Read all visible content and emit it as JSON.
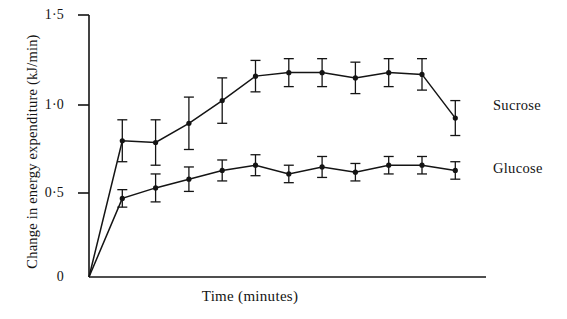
{
  "chart_data": {
    "type": "line",
    "title": "",
    "subtitle": "",
    "xlabel": "Time (minutes)",
    "ylabel": "Change in energy expenditure (kJ/min)",
    "ylim": [
      0,
      1.5
    ],
    "xlim": [
      0,
      12
    ],
    "grid": false,
    "legend_position": "right-inline",
    "ytick_labels": [
      "0",
      "0·5",
      "1·0",
      "1·5"
    ],
    "ytick_values": [
      0,
      0.5,
      1.0,
      1.5
    ],
    "xtick_labels": [],
    "x": [
      1,
      2,
      3,
      4,
      5,
      6,
      7,
      8,
      9,
      10,
      11
    ],
    "series": [
      {
        "name": "Sucrose",
        "values": [
          0.78,
          0.77,
          0.88,
          1.01,
          1.15,
          1.17,
          1.17,
          1.14,
          1.17,
          1.16,
          0.91
        ],
        "errors": [
          0.12,
          0.13,
          0.15,
          0.13,
          0.09,
          0.08,
          0.08,
          0.09,
          0.08,
          0.09,
          0.1
        ]
      },
      {
        "name": "Glucose",
        "values": [
          0.45,
          0.51,
          0.56,
          0.61,
          0.64,
          0.59,
          0.63,
          0.6,
          0.64,
          0.64,
          0.61
        ],
        "errors": [
          0.05,
          0.08,
          0.07,
          0.06,
          0.06,
          0.05,
          0.06,
          0.05,
          0.05,
          0.05,
          0.05
        ]
      }
    ],
    "origin_note": "Both series start at 0 at time zero"
  },
  "axes": {
    "y_label": "Change in energy expenditure (kJ/min)",
    "x_label": "Time (minutes)",
    "tick_0": "0",
    "tick_05": "0·5",
    "tick_10": "1·0",
    "tick_15": "1·5"
  },
  "labels": {
    "sucrose": "Sucrose",
    "glucose": "Glucose"
  },
  "colors": {
    "line": "#141414",
    "background": "#ffffff",
    "axis": "#141414"
  }
}
